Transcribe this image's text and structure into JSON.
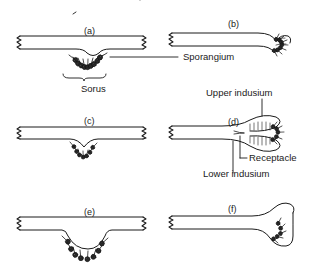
{
  "figure": {
    "title_visible": false,
    "background_color": "#ffffff",
    "ink_color": "#1a1a1a"
  },
  "panels": [
    {
      "id": "a",
      "label": "(a)",
      "x": 84,
      "y": 27,
      "type": "superficial-sorus-no-indusium"
    },
    {
      "id": "b",
      "label": "(b)",
      "x": 228,
      "y": 20,
      "type": "marginal-sorus-reflexed-margin"
    },
    {
      "id": "c",
      "label": "(c)",
      "x": 84,
      "y": 117,
      "type": "shallow-sunken-sorus"
    },
    {
      "id": "d",
      "label": "(d)",
      "x": 228,
      "y": 118,
      "type": "bivalvate-indusium"
    },
    {
      "id": "e",
      "label": "(e)",
      "x": 84,
      "y": 208,
      "type": "deep-pouch-sorus"
    },
    {
      "id": "f",
      "label": "(f)",
      "x": 228,
      "y": 205,
      "type": "hooded-marginal-sorus"
    }
  ],
  "annotations": [
    {
      "id": "sporangium",
      "text": "Sporangium",
      "x": 183,
      "y": 57,
      "leader": "horizontal"
    },
    {
      "id": "sorus",
      "text": "Sorus",
      "x": 81,
      "y": 84,
      "leader": "brace"
    },
    {
      "id": "upper-indusium",
      "text": "Upper indusium",
      "x": 260,
      "y": 92,
      "leader": "vertical"
    },
    {
      "id": "receptacle",
      "text": "Receptacle",
      "x": 281,
      "y": 158,
      "leader": "vertical"
    },
    {
      "id": "lower-indusium",
      "text": "Lower indusium",
      "x": 264,
      "y": 173,
      "leader": "vertical"
    }
  ]
}
